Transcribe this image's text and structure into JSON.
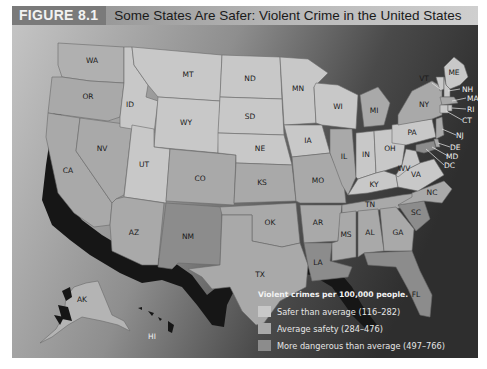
{
  "header": {
    "figure_number": "FIGURE 8.1",
    "title": "Some States Are Safer: Violent Crime in the United States"
  },
  "colors": {
    "safer": "#c8c8c8",
    "average": "#a9a9a9",
    "dangerous": "#8c8c8c",
    "ocean_light": "#bdbdbd",
    "ocean_dark": "#3a3a3a",
    "coast_shadow": "#161616"
  },
  "legend": {
    "title": "Violent crimes per 100,000 people.",
    "items": [
      {
        "label": "Safer than average (116–282)",
        "category": "safer"
      },
      {
        "label": "Average safety (284–476)",
        "category": "average"
      },
      {
        "label": "More dangerous than average (497–766)",
        "category": "dangerous"
      }
    ]
  },
  "states": {
    "WA": "WA",
    "OR": "OR",
    "CA": "CA",
    "NV": "NV",
    "ID": "ID",
    "MT": "MT",
    "WY": "WY",
    "UT": "UT",
    "AZ": "AZ",
    "CO": "CO",
    "NM": "NM",
    "ND": "ND",
    "SD": "SD",
    "NE": "NE",
    "KS": "KS",
    "OK": "OK",
    "TX": "TX",
    "MN": "MN",
    "IA": "IA",
    "MO": "MO",
    "AR": "AR",
    "LA": "LA",
    "WI": "WI",
    "IL": "IL",
    "MI": "MI",
    "IN": "IN",
    "OH": "OH",
    "KY": "KY",
    "TN": "TN",
    "MS": "MS",
    "AL": "AL",
    "GA": "GA",
    "FL": "FL",
    "SC": "SC",
    "NC": "NC",
    "VA": "VA",
    "WV": "WV",
    "PA": "PA",
    "NY": "NY",
    "VT": "VT",
    "ME": "ME",
    "NH": "NH",
    "MA": "MA",
    "RI": "RI",
    "CT": "CT",
    "NJ": "NJ",
    "DE": "DE",
    "MD": "MD",
    "DC": "DC",
    "AK": "AK",
    "HI": "HI"
  }
}
